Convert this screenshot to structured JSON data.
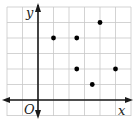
{
  "chart_data": {
    "type": "scatter",
    "title": "",
    "xlabel": "x",
    "ylabel": "y",
    "origin_label": "O",
    "grid": true,
    "xlim": [
      -2,
      6
    ],
    "ylim": [
      -1,
      6
    ],
    "points": [
      {
        "x": 1,
        "y": 4
      },
      {
        "x": 2.5,
        "y": 4
      },
      {
        "x": 4,
        "y": 5
      },
      {
        "x": 2.5,
        "y": 2
      },
      {
        "x": 5,
        "y": 2
      },
      {
        "x": 3.5,
        "y": 1
      }
    ],
    "colors": {
      "grid": "#c8c8c8",
      "axis": "#1a1a1a",
      "point": "#000000"
    }
  },
  "labels": {
    "x": "x",
    "y": "y",
    "origin": "O"
  }
}
